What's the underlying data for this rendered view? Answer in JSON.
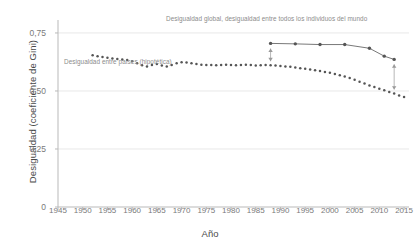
{
  "chart_data": {
    "type": "line",
    "title": "",
    "xlabel": "Año",
    "ylabel": "Desigualdad (coeficiente de Gini)",
    "xlim": [
      1945,
      2016
    ],
    "ylim": [
      0,
      0.78
    ],
    "xticks": [
      1945,
      1950,
      1955,
      1960,
      1965,
      1970,
      1975,
      1980,
      1985,
      1990,
      1995,
      2000,
      2005,
      2010,
      2015
    ],
    "xticklabels": [
      "1945",
      "1950",
      "1955",
      "1960",
      "1965",
      "1970",
      "1975",
      "1980",
      "1985",
      "1990",
      "1995",
      "2000",
      "2005",
      "2010",
      "2015"
    ],
    "yticks": [
      0,
      0.25,
      0.5,
      0.75
    ],
    "yticklabels": [
      "0",
      "0,25",
      "0,50",
      "0,75"
    ],
    "grid": "horizontal-light",
    "legend": "inline-annotations",
    "series": [
      {
        "name": "Desigualdad entre países (hipotética)",
        "style": "dotted-markers",
        "color": "#555555",
        "x": [
          1952,
          1953,
          1954,
          1955,
          1956,
          1957,
          1958,
          1959,
          1960,
          1961,
          1962,
          1963,
          1964,
          1965,
          1966,
          1967,
          1968,
          1969,
          1970,
          1971,
          1972,
          1973,
          1974,
          1975,
          1976,
          1977,
          1978,
          1979,
          1980,
          1981,
          1982,
          1983,
          1984,
          1985,
          1986,
          1987,
          1988,
          1989,
          1990,
          1991,
          1992,
          1993,
          1994,
          1995,
          1996,
          1997,
          1998,
          1999,
          2000,
          2001,
          2002,
          2003,
          2004,
          2005,
          2006,
          2007,
          2008,
          2009,
          2010,
          2011,
          2012,
          2013,
          2014,
          2015
        ],
        "y": [
          0.654,
          0.65,
          0.646,
          0.643,
          0.64,
          0.638,
          0.636,
          0.633,
          0.628,
          0.619,
          0.611,
          0.606,
          0.612,
          0.616,
          0.61,
          0.605,
          0.612,
          0.62,
          0.624,
          0.623,
          0.62,
          0.616,
          0.613,
          0.612,
          0.612,
          0.611,
          0.612,
          0.613,
          0.612,
          0.611,
          0.612,
          0.613,
          0.612,
          0.61,
          0.611,
          0.612,
          0.611,
          0.61,
          0.608,
          0.606,
          0.604,
          0.601,
          0.598,
          0.596,
          0.593,
          0.589,
          0.586,
          0.582,
          0.578,
          0.573,
          0.568,
          0.562,
          0.556,
          0.548,
          0.54,
          0.532,
          0.524,
          0.517,
          0.51,
          0.503,
          0.496,
          0.489,
          0.481,
          0.474
        ]
      },
      {
        "name": "Desigualdad global, desigualdad entre todos los individuos del mundo",
        "style": "line-markers",
        "color": "#555555",
        "x": [
          1988,
          1993,
          1998,
          2003,
          2008,
          2011,
          2013
        ],
        "y": [
          0.705,
          0.703,
          0.7,
          0.7,
          0.684,
          0.65,
          0.636
        ]
      }
    ],
    "annotations": [
      {
        "name": "global-label",
        "text": "Desigualdad global, desigualdad entre todos los individuos del mundo",
        "x": 1988,
        "y": 0.76
      },
      {
        "name": "countries-label",
        "text": "Desigualdad entre países (hipotética)",
        "x": 1958,
        "y": 0.555
      },
      {
        "name": "gap-arrow-left",
        "type": "double-arrow",
        "x": 1988,
        "y_top": 0.7,
        "y_bottom": 0.611
      },
      {
        "name": "gap-arrow-right",
        "type": "double-arrow",
        "x": 2013,
        "y_top": 0.632,
        "y_bottom": 0.489
      }
    ]
  },
  "axes": {
    "x_title": "Año",
    "y_title": "Desigualdad (coeficiente de Gini)",
    "x_ticks": [
      "1945",
      "1950",
      "1955",
      "1960",
      "1965",
      "1970",
      "1975",
      "1980",
      "1985",
      "1990",
      "1995",
      "2000",
      "2005",
      "2010",
      "2015"
    ],
    "y_ticks": [
      "0,75",
      "0,50",
      "0,25",
      "0"
    ]
  },
  "labels": {
    "global": "Desigualdad global, desigualdad entre todos los individuos del mundo",
    "countries": "Desigualdad entre países (hipotética)"
  },
  "colors": {
    "series": "#555555",
    "axis": "#b9b9b9",
    "grid": "#e8e8e8",
    "text": "#6e6e6e",
    "annotation": "#8c8c8c"
  }
}
